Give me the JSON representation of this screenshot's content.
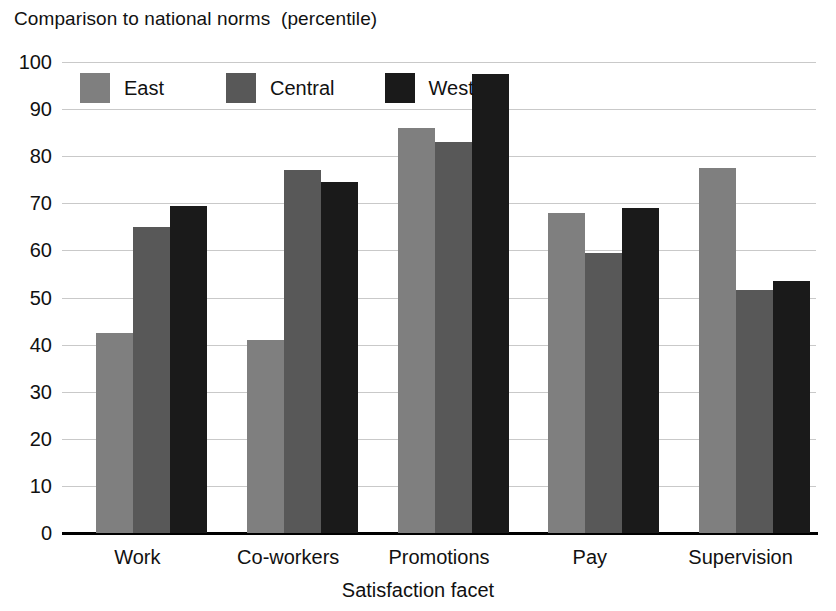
{
  "chart_data": {
    "type": "bar",
    "title": "Comparison to national norms  (percentile)",
    "xlabel": "Satisfaction facet",
    "ylabel": "",
    "categories": [
      "Work",
      "Co-workers",
      "Promotions",
      "Pay",
      "Supervision"
    ],
    "series": [
      {
        "name": "East",
        "color": "#7f7f7f",
        "values": [
          42.5,
          41.0,
          86.0,
          68.0,
          77.5
        ]
      },
      {
        "name": "Central",
        "color": "#585858",
        "values": [
          65.0,
          77.0,
          83.0,
          59.5,
          51.5
        ]
      },
      {
        "name": "West",
        "color": "#1a1a1a",
        "values": [
          69.5,
          74.5,
          97.5,
          69.0,
          53.5
        ]
      }
    ],
    "ylim": [
      0,
      100
    ],
    "ytick_step": 10,
    "ytick_labels": [
      "100",
      "90",
      "80",
      "70",
      "60",
      "50",
      "40",
      "30",
      "20",
      "10",
      "0"
    ],
    "grid": true,
    "grid_color": "#c9c9c9",
    "legend_position": "top-left-inside",
    "axis_color": "#000000",
    "background": "#ffffff"
  }
}
